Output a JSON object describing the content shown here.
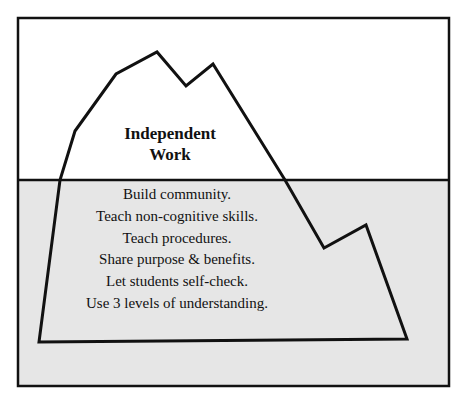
{
  "diagram": {
    "type": "iceberg",
    "colors": {
      "background": "#ffffff",
      "water": "#e6e6e6",
      "stroke": "#111111"
    },
    "above_water": {
      "label_lines": [
        "Independent",
        "Work"
      ]
    },
    "below_water": {
      "items": [
        "Build community.",
        "Teach non-cognitive skills.",
        "Teach procedures.",
        "Share purpose & benefits.",
        "Let students self-check.",
        "Use 3 levels of understanding."
      ]
    }
  }
}
